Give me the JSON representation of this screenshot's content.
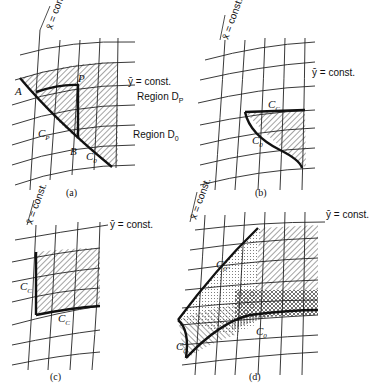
{
  "figure": {
    "panels": [
      {
        "id": "a",
        "caption": "(a)",
        "axis_labels": {
          "x": "x̄ = const.",
          "y": "ȳ = const."
        },
        "labels": {
          "A": "A",
          "B": "B",
          "P": "P",
          "region_p": "Region D",
          "region_p_sub": "P",
          "region_0": "Region D",
          "region_0_sub": "0",
          "curve_p": "C",
          "curve_p_sub": "P",
          "curve_0": "C",
          "curve_0_sub": "0"
        }
      },
      {
        "id": "b",
        "caption": "(b)",
        "axis_labels": {
          "x": "x̄ = const.",
          "y": "ȳ = const."
        },
        "labels": {
          "curve_c": "C",
          "curve_c_sub": "C",
          "curve_0": "C",
          "curve_0_sub": "0"
        }
      },
      {
        "id": "c",
        "caption": "(c)",
        "axis_labels": {
          "x": "x̄ = const.",
          "y": "ȳ = const."
        },
        "labels": {
          "curve_c_vert": "C",
          "curve_c_vert_sub": "C",
          "curve_c_horiz": "C",
          "curve_c_horiz_sub": "C"
        }
      },
      {
        "id": "d",
        "caption": "(d)",
        "axis_labels": {
          "x": "x̄ = const.",
          "y": "ȳ = const."
        },
        "labels": {
          "curve_0pp": "C",
          "curve_0pp_sub": "0''",
          "curve_0": "C",
          "curve_0_sub": "0",
          "curve_0_left": "C",
          "curve_0_left_sub": "0"
        }
      }
    ]
  }
}
